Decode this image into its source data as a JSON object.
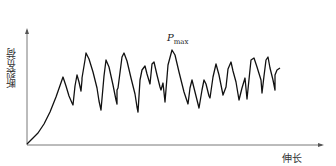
{
  "chart_data": {
    "type": "line",
    "title": "",
    "xlabel": "伸长",
    "ylabel": "断裂负荷",
    "annotation": {
      "text": "P",
      "subscript": "max",
      "position": "at global peak"
    },
    "grid": false,
    "ticks": "none",
    "points_px": [
      [
        27,
        144
      ],
      [
        32,
        139
      ],
      [
        38,
        133
      ],
      [
        44,
        124
      ],
      [
        50,
        112
      ],
      [
        56,
        97
      ],
      [
        63,
        77
      ],
      [
        66,
        86
      ],
      [
        69,
        96
      ],
      [
        72,
        103
      ],
      [
        73,
        105
      ],
      [
        75,
        86
      ],
      [
        77,
        75
      ],
      [
        79,
        82
      ],
      [
        81,
        91
      ],
      [
        82,
        80
      ],
      [
        82,
        78
      ],
      [
        85,
        60
      ],
      [
        86,
        53
      ],
      [
        89,
        59
      ],
      [
        93,
        72
      ],
      [
        97,
        88
      ],
      [
        99,
        101
      ],
      [
        101,
        110
      ],
      [
        104,
        76
      ],
      [
        106,
        60
      ],
      [
        109,
        67
      ],
      [
        113,
        85
      ],
      [
        116,
        100
      ],
      [
        117,
        104
      ],
      [
        117,
        90
      ],
      [
        118,
        88
      ],
      [
        122,
        57
      ],
      [
        124,
        53
      ],
      [
        127,
        61
      ],
      [
        131,
        78
      ],
      [
        135,
        94
      ],
      [
        137,
        107
      ],
      [
        138,
        112
      ],
      [
        140,
        80
      ],
      [
        142,
        70
      ],
      [
        145,
        66
      ],
      [
        147,
        74
      ],
      [
        150,
        84
      ],
      [
        152,
        64
      ],
      [
        154,
        62
      ],
      [
        157,
        75
      ],
      [
        160,
        87
      ],
      [
        161,
        90
      ],
      [
        163,
        83
      ],
      [
        165,
        102
      ],
      [
        168,
        65
      ],
      [
        172,
        50
      ],
      [
        175,
        55
      ],
      [
        179,
        72
      ],
      [
        184,
        92
      ],
      [
        188,
        104
      ],
      [
        190,
        88
      ],
      [
        192,
        80
      ],
      [
        195,
        92
      ],
      [
        199,
        108
      ],
      [
        202,
        90
      ],
      [
        204,
        80
      ],
      [
        206,
        84
      ],
      [
        209,
        96
      ],
      [
        210,
        98
      ],
      [
        213,
        77
      ],
      [
        216,
        64
      ],
      [
        219,
        75
      ],
      [
        223,
        95
      ],
      [
        226,
        87
      ],
      [
        228,
        69
      ],
      [
        231,
        62
      ],
      [
        233,
        71
      ],
      [
        236,
        82
      ],
      [
        239,
        100
      ],
      [
        242,
        88
      ],
      [
        245,
        78
      ],
      [
        247,
        99
      ],
      [
        251,
        60
      ],
      [
        254,
        58
      ],
      [
        257,
        67
      ],
      [
        261,
        80
      ],
      [
        262,
        93
      ],
      [
        264,
        76
      ],
      [
        266,
        60
      ],
      [
        268,
        57
      ],
      [
        270,
        68
      ],
      [
        273,
        80
      ],
      [
        275,
        90
      ],
      [
        275,
        75
      ],
      [
        277,
        70
      ],
      [
        280,
        68
      ]
    ]
  }
}
